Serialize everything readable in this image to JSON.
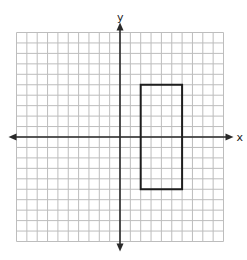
{
  "chart_data": {
    "type": "diagram",
    "title": "",
    "axes": {
      "x_label": "x",
      "y_label": "y",
      "x_range": [
        -10,
        10
      ],
      "y_range": [
        -10,
        10
      ],
      "grid": true,
      "grid_step": 1,
      "tick_labels": false
    },
    "shapes": [
      {
        "type": "rectangle",
        "vertices": [
          [
            2,
            5
          ],
          [
            6,
            5
          ],
          [
            6,
            -5
          ],
          [
            2,
            -5
          ]
        ],
        "x_min": 2,
        "x_max": 6,
        "y_min": -5,
        "y_max": 5,
        "width": 4,
        "height": 10
      }
    ]
  },
  "labels": {
    "x_axis": "x",
    "y_axis": "y"
  },
  "colors": {
    "grid": "#bdbdbd",
    "axis": "#2a2a2a",
    "shape": "#1e1e1e",
    "background": "#ffffff"
  },
  "layout": {
    "origin_px": [
      120,
      137
    ],
    "cell_px_x": 10.35,
    "cell_px_y": 10.45
  }
}
